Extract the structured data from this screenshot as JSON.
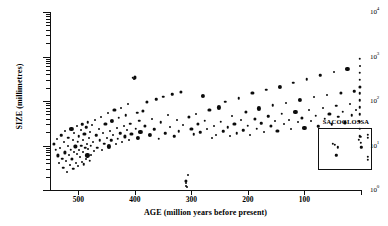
{
  "chart_data": {
    "type": "scatter",
    "title": "",
    "xlabel": "AGE (million years before present)",
    "ylabel": "SIZE (millimetres)",
    "xlim": [
      550,
      0
    ],
    "ylim": [
      1,
      10000
    ],
    "yscale": "log",
    "xscale": "linear",
    "grid": false,
    "legend": null,
    "xticks": [
      500,
      400,
      300,
      200,
      100
    ],
    "xtick_labels": [
      "500",
      "400",
      "300",
      "200",
      "100"
    ],
    "yticks": [
      1,
      10,
      100,
      1000,
      10000
    ],
    "ytick_labels": [
      "10",
      "10",
      "10",
      "10",
      "10"
    ],
    "ytick_exponents": [
      "0",
      "1",
      "2",
      "3",
      "4"
    ],
    "annotations": [
      {
        "text": "SACOGLOSSA",
        "x": 45,
        "y": 3.0,
        "kind": "inset-box-label"
      }
    ],
    "inset": {
      "label": "SACOGLOSSA",
      "xrange": [
        60,
        0
      ],
      "yrange": [
        1.5,
        40
      ],
      "points": [
        [
          44,
          12
        ],
        [
          42,
          11
        ],
        [
          38,
          9
        ],
        [
          40,
          4.5
        ],
        [
          14,
          17
        ],
        [
          12,
          22
        ],
        [
          12,
          13
        ],
        [
          11,
          9
        ],
        [
          4,
          26
        ],
        [
          4,
          20
        ],
        [
          4,
          4
        ],
        [
          4,
          3
        ]
      ]
    },
    "series": [
      {
        "name": "fossil and living gastropod body size",
        "marker": "filled-circle",
        "color": "#0b0b0b",
        "points": [
          [
            543,
            11
          ],
          [
            540,
            8
          ],
          [
            538,
            14
          ],
          [
            536,
            6
          ],
          [
            534,
            4
          ],
          [
            532,
            9
          ],
          [
            530,
            17
          ],
          [
            528,
            5
          ],
          [
            527,
            3.2
          ],
          [
            526,
            12
          ],
          [
            524,
            7
          ],
          [
            523,
            21
          ],
          [
            521,
            4.5
          ],
          [
            520,
            2.6
          ],
          [
            519,
            10
          ],
          [
            518,
            15
          ],
          [
            516,
            6
          ],
          [
            515,
            3.6
          ],
          [
            513,
            8
          ],
          [
            512,
            24
          ],
          [
            511,
            5
          ],
          [
            510,
            13
          ],
          [
            509,
            3
          ],
          [
            508,
            19
          ],
          [
            507,
            7
          ],
          [
            505,
            9.5
          ],
          [
            504,
            4
          ],
          [
            503,
            28
          ],
          [
            502,
            6.5
          ],
          [
            501,
            12
          ],
          [
            500,
            3.4
          ],
          [
            499,
            16
          ],
          [
            498,
            8
          ],
          [
            497,
            5.5
          ],
          [
            496,
            22
          ],
          [
            495,
            10
          ],
          [
            494,
            4.2
          ],
          [
            493,
            30
          ],
          [
            492,
            7
          ],
          [
            491,
            13
          ],
          [
            490,
            3.8
          ],
          [
            489,
            18
          ],
          [
            488,
            9
          ],
          [
            487,
            5
          ],
          [
            486,
            26
          ],
          [
            485,
            11
          ],
          [
            484,
            6
          ],
          [
            483,
            33
          ],
          [
            482,
            8.5
          ],
          [
            481,
            15
          ],
          [
            480,
            4.6
          ],
          [
            479,
            20
          ],
          [
            478,
            10
          ],
          [
            477,
            6.2
          ],
          [
            476,
            29
          ],
          [
            474,
            12
          ],
          [
            472,
            7.5
          ],
          [
            470,
            38
          ],
          [
            468,
            17
          ],
          [
            466,
            9
          ],
          [
            464,
            23
          ],
          [
            462,
            13
          ],
          [
            460,
            44
          ],
          [
            458,
            8
          ],
          [
            456,
            19
          ],
          [
            454,
            11
          ],
          [
            452,
            31
          ],
          [
            450,
            15
          ],
          [
            448,
            55
          ],
          [
            446,
            9.5
          ],
          [
            444,
            21
          ],
          [
            442,
            13
          ],
          [
            440,
            36
          ],
          [
            438,
            17
          ],
          [
            436,
            62
          ],
          [
            434,
            11
          ],
          [
            432,
            25
          ],
          [
            430,
            14
          ],
          [
            428,
            42
          ],
          [
            426,
            19
          ],
          [
            424,
            70
          ],
          [
            422,
            12
          ],
          [
            420,
            28
          ],
          [
            418,
            16
          ],
          [
            416,
            48
          ],
          [
            414,
            22
          ],
          [
            412,
            85
          ],
          [
            410,
            13
          ],
          [
            408,
            31
          ],
          [
            406,
            18
          ],
          [
            404,
            330
          ],
          [
            402,
            310
          ],
          [
            400,
            340
          ],
          [
            398,
            24
          ],
          [
            396,
            55
          ],
          [
            394,
            15
          ],
          [
            392,
            36
          ],
          [
            390,
            20
          ],
          [
            386,
            60
          ],
          [
            382,
            27
          ],
          [
            378,
            95
          ],
          [
            374,
            17
          ],
          [
            370,
            40
          ],
          [
            366,
            23
          ],
          [
            362,
            110
          ],
          [
            358,
            14
          ],
          [
            354,
            33
          ],
          [
            350,
            125
          ],
          [
            346,
            19
          ],
          [
            342,
            48
          ],
          [
            338,
            26
          ],
          [
            334,
            140
          ],
          [
            330,
            16
          ],
          [
            326,
            38
          ],
          [
            322,
            21
          ],
          [
            318,
            160
          ],
          [
            314,
            29
          ],
          [
            310,
            1.6
          ],
          [
            310,
            1.4
          ],
          [
            309,
            1.25
          ],
          [
            308,
            1.15
          ],
          [
            306,
            2.2
          ],
          [
            304,
            44
          ],
          [
            300,
            24
          ],
          [
            296,
            18
          ],
          [
            292,
            52
          ],
          [
            288,
            30
          ],
          [
            284,
            20
          ],
          [
            280,
            130
          ],
          [
            276,
            36
          ],
          [
            272,
            23
          ],
          [
            268,
            62
          ],
          [
            264,
            15
          ],
          [
            260,
            28
          ],
          [
            256,
            17
          ],
          [
            252,
            72
          ],
          [
            248,
            34
          ],
          [
            244,
            21
          ],
          [
            240,
            95
          ],
          [
            236,
            26
          ],
          [
            232,
            16
          ],
          [
            228,
            45
          ],
          [
            224,
            31
          ],
          [
            220,
            19
          ],
          [
            216,
            115
          ],
          [
            212,
            37
          ],
          [
            208,
            22
          ],
          [
            204,
            58
          ],
          [
            200,
            28
          ],
          [
            196,
            17
          ],
          [
            192,
            150
          ],
          [
            188,
            40
          ],
          [
            184,
            24
          ],
          [
            180,
            68
          ],
          [
            176,
            32
          ],
          [
            172,
            20
          ],
          [
            168,
            180
          ],
          [
            164,
            46
          ],
          [
            160,
            27
          ],
          [
            156,
            80
          ],
          [
            152,
            35
          ],
          [
            148,
            21
          ],
          [
            144,
            210
          ],
          [
            140,
            52
          ],
          [
            136,
            30
          ],
          [
            132,
            92
          ],
          [
            128,
            38
          ],
          [
            124,
            23
          ],
          [
            120,
            260
          ],
          [
            116,
            58
          ],
          [
            112,
            33
          ],
          [
            108,
            105
          ],
          [
            104,
            42
          ],
          [
            100,
            25
          ],
          [
            96,
            310
          ],
          [
            92,
            64
          ],
          [
            88,
            36
          ],
          [
            84,
            120
          ],
          [
            80,
            47
          ],
          [
            76,
            27
          ],
          [
            72,
            380
          ],
          [
            68,
            70
          ],
          [
            64,
            40
          ],
          [
            60,
            135
          ],
          [
            56,
            52
          ],
          [
            52,
            30
          ],
          [
            48,
            450
          ],
          [
            44,
            78
          ],
          [
            40,
            44
          ],
          [
            36,
            150
          ],
          [
            32,
            57
          ],
          [
            28,
            33
          ],
          [
            24,
            520
          ],
          [
            20,
            86
          ],
          [
            16,
            48
          ],
          [
            12,
            165
          ],
          [
            8,
            62
          ],
          [
            4,
            36
          ],
          [
            2,
            900
          ],
          [
            2,
            620
          ],
          [
            2,
            430
          ],
          [
            2,
            300
          ],
          [
            2,
            210
          ],
          [
            2,
            150
          ],
          [
            2,
            105
          ],
          [
            2,
            72
          ],
          [
            2,
            50
          ],
          [
            2,
            34
          ],
          [
            2,
            24
          ],
          [
            2,
            16
          ]
        ]
      }
    ]
  }
}
